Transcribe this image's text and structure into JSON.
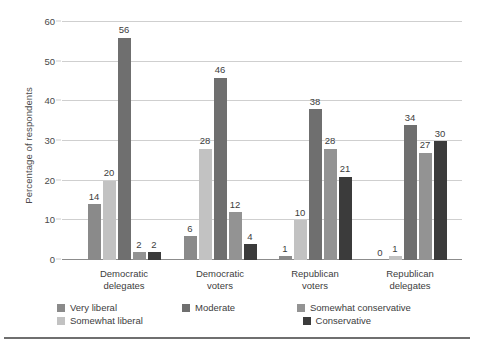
{
  "chart_data": {
    "type": "bar",
    "title": "",
    "subtitle": "",
    "xlabel": "",
    "ylabel": "Percentage of respondents",
    "ylim": [
      0,
      60
    ],
    "yticks": [
      0,
      10,
      20,
      30,
      40,
      50,
      60
    ],
    "ytick_labels": [
      "0",
      "10",
      "20",
      "30",
      "40",
      "50",
      "60"
    ],
    "grid": true,
    "legend_position": "bottom",
    "categories": [
      "Democratic delegates",
      "Democratic voters",
      "Republican voters",
      "Republican delegates"
    ],
    "category_lines": [
      [
        "Democratic",
        "delegates"
      ],
      [
        "Democratic",
        "voters"
      ],
      [
        "Republican",
        "voters"
      ],
      [
        "Republican",
        "delegates"
      ]
    ],
    "series": [
      {
        "name": "Very liberal",
        "color": "#8a8a8a",
        "values": [
          14,
          6,
          1,
          0
        ]
      },
      {
        "name": "Somewhat liberal",
        "color": "#c2c2c2",
        "values": [
          20,
          28,
          10,
          1
        ]
      },
      {
        "name": "Moderate",
        "color": "#6f6f6f",
        "values": [
          56,
          46,
          38,
          34
        ]
      },
      {
        "name": "Somewhat conservative",
        "color": "#939393",
        "values": [
          2,
          12,
          28,
          27
        ]
      },
      {
        "name": "Conservative",
        "color": "#3b3b3b",
        "values": [
          2,
          4,
          21,
          30
        ]
      }
    ]
  },
  "legend": {
    "items": [
      {
        "label": "Very liberal",
        "color": "#8a8a8a"
      },
      {
        "label": "Moderate",
        "color": "#6f6f6f"
      },
      {
        "label": "Somewhat conservative",
        "color": "#939393"
      },
      {
        "label": "Somewhat liberal",
        "color": "#c2c2c2"
      },
      {
        "label": "Conservative",
        "color": "#3b3b3b"
      }
    ]
  }
}
